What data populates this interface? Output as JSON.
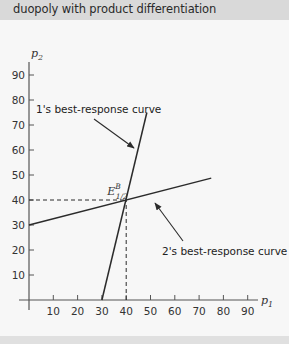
{
  "header": {
    "title": "duopoly with product differentiation"
  },
  "colors": {
    "header_bg": "#d9d9d9",
    "panel_bg": "#f7f7f7",
    "line": "#2b2b2b",
    "text": "#222222"
  },
  "chart_data": {
    "type": "line",
    "title": "duopoly with product differentiation",
    "xlabel": "p1",
    "ylabel": "p2",
    "xlim": [
      0,
      95
    ],
    "ylim": [
      0,
      95
    ],
    "x_ticks": [
      10,
      20,
      30,
      40,
      50,
      60,
      70,
      80,
      90
    ],
    "y_ticks": [
      10,
      20,
      30,
      40,
      50,
      60,
      70,
      80,
      90
    ],
    "grid": false,
    "legend": null,
    "series": [
      {
        "name": "1's best-response curve",
        "points": [
          [
            30,
            0
          ],
          [
            48.5,
            75
          ]
        ]
      },
      {
        "name": "2's best-response curve",
        "points": [
          [
            0,
            30
          ],
          [
            75,
            48.75
          ]
        ]
      }
    ],
    "equilibrium": {
      "label": "E",
      "superscript": "B",
      "subscript": "1/2",
      "x": 40,
      "y": 40
    },
    "guides": [
      {
        "style": "dashed",
        "from": [
          0,
          40
        ],
        "to": [
          40,
          40
        ]
      },
      {
        "style": "dashed",
        "from": [
          40,
          0
        ],
        "to": [
          40,
          40
        ]
      }
    ],
    "annotations": [
      {
        "text": "1's best-response curve",
        "arrow_to_series": "1's best-response curve"
      },
      {
        "text": "2's best-response curve",
        "arrow_to_series": "2's best-response curve"
      }
    ]
  }
}
